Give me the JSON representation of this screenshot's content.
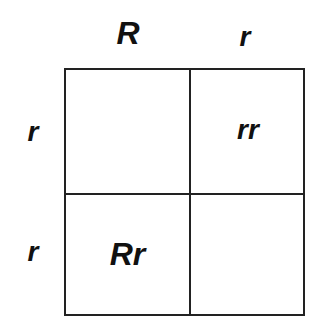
{
  "diagram": {
    "type": "punnett-square",
    "column_alleles": [
      "R",
      "r"
    ],
    "row_alleles": [
      "r",
      "r"
    ],
    "cells": [
      [
        "",
        "rr"
      ],
      [
        "Rr",
        ""
      ]
    ],
    "line_color": "#222222",
    "text_color": "#111111"
  }
}
